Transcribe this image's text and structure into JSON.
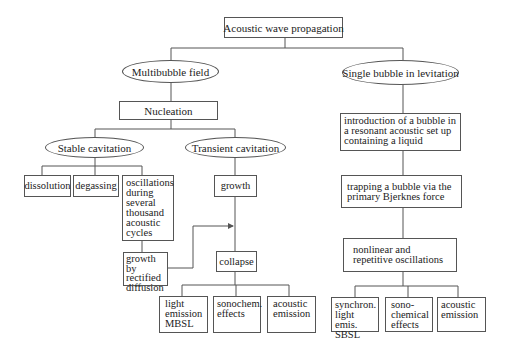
{
  "diagram": {
    "root": "Acoustic wave propagation",
    "multibubble": {
      "label": "Multibubble field",
      "nucleation": "Nucleation",
      "stable": {
        "label": "Stable cavitation",
        "children": [
          "dissolution",
          "degassing",
          "oscillations during several thousand acoustic cycles"
        ],
        "rectified": "growth by rectified diffusion"
      },
      "transient": {
        "label": "Transient cavitation",
        "growth": "growth",
        "collapse": "collapse",
        "effects": [
          "light emission MBSL",
          "sonochem. effects",
          "acoustic emission"
        ]
      }
    },
    "single": {
      "label": "Single bubble in levitation",
      "steps": [
        "introduction of a bubble in a resonant acoustic set up containing a liquid",
        "trapping a bubble via the primary Bjerknes force",
        "nonlinear and repetitive oscillations"
      ],
      "effects": [
        "synchron. light emis. SBSL",
        "sono-chemical effects",
        "acoustic emission"
      ]
    }
  },
  "colors": {
    "line": "#555555",
    "text": "#222222",
    "background": "#ffffff"
  }
}
